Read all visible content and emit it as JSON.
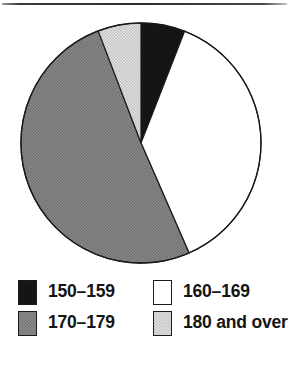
{
  "figure": {
    "has_top_rule": true,
    "background_color": "#ffffff"
  },
  "chart_data": {
    "type": "pie",
    "title": "",
    "subtitle": "",
    "xlabel": "",
    "ylabel": "",
    "grid": false,
    "legend_position": "bottom",
    "legend_layout": "2x2",
    "start_angle_deg": 0,
    "direction": "clockwise",
    "center": {
      "x": 141,
      "y": 143
    },
    "radius": 120,
    "categories": [
      "150–159",
      "160–169",
      "170–179",
      "180 and over"
    ],
    "values": [
      5.9,
      37.5,
      50.7,
      5.9
    ],
    "value_unit": "percent",
    "angles_deg": [
      21.3,
      135.1,
      182.5,
      21.1
    ],
    "slices": [
      {
        "label": "150–159",
        "percent": 5.9,
        "angle_deg": 21.3,
        "start_deg": 0,
        "end_deg": 21.3,
        "fill": "#151515",
        "pattern": "solid-black",
        "edge_color": "#1a1a1a"
      },
      {
        "label": "160–169",
        "percent": 37.5,
        "angle_deg": 135.1,
        "start_deg": 21.3,
        "end_deg": 156.4,
        "fill": "#ffffff",
        "pattern": "solid-white",
        "edge_color": "#1a1a1a"
      },
      {
        "label": "170–179",
        "percent": 50.7,
        "angle_deg": 182.7,
        "start_deg": 156.4,
        "end_deg": 339.1,
        "fill": "#8d8d8d",
        "pattern": "dither-medium-gray",
        "edge_color": "#1a1a1a"
      },
      {
        "label": "180 and over",
        "percent": 5.9,
        "angle_deg": 20.9,
        "start_deg": 339.1,
        "end_deg": 360,
        "fill": "#e0e0e0",
        "pattern": "dither-light-gray",
        "edge_color": "#1a1a1a"
      }
    ]
  },
  "legend": {
    "rows": [
      {
        "left": {
          "label": "150–159",
          "swatch": "black",
          "color": "#151515"
        },
        "right": {
          "label": "160–169",
          "swatch": "white",
          "color": "#ffffff"
        }
      },
      {
        "left": {
          "label": "170–179",
          "swatch": "midgray",
          "color": "#8d8d8d"
        },
        "right": {
          "label": "180 and over",
          "swatch": "litegray",
          "color": "#e0e0e0"
        }
      }
    ]
  }
}
